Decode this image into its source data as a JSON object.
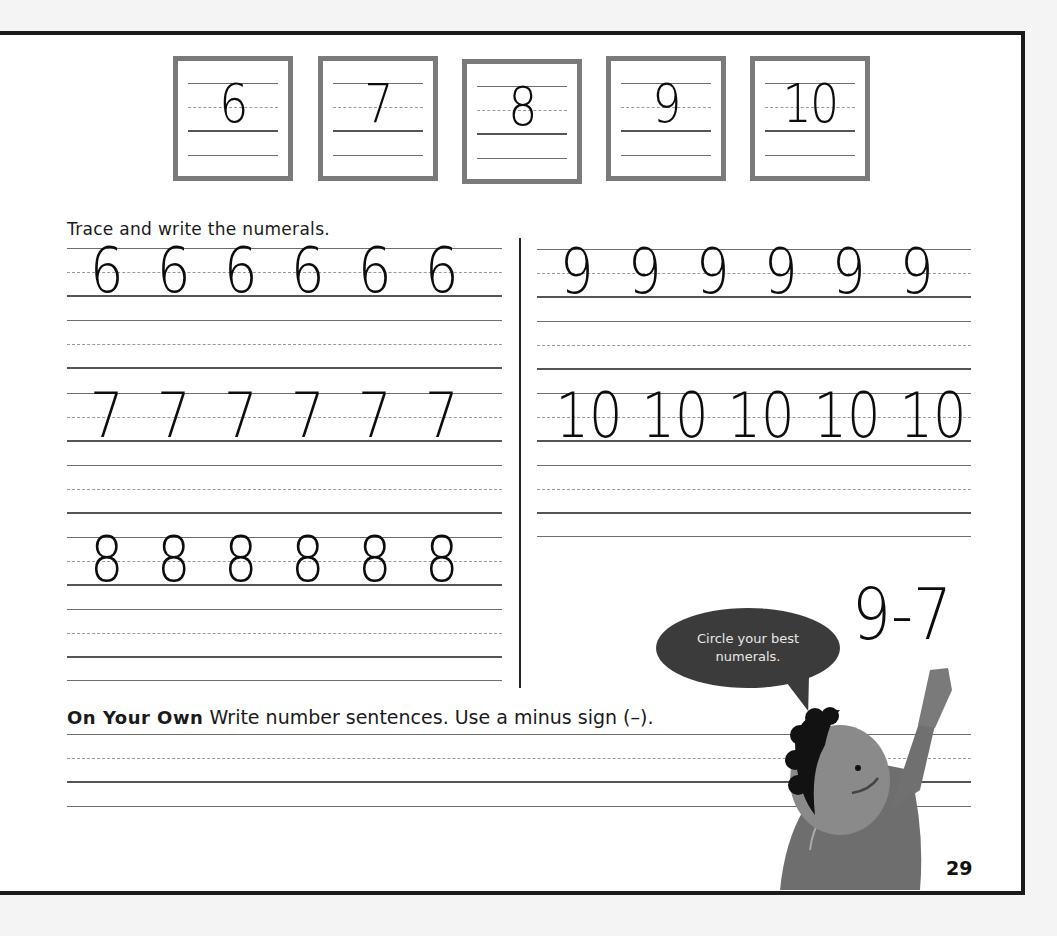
{
  "page": {
    "page_number": "29",
    "models": [
      "6",
      "7",
      "8",
      "9",
      "10"
    ],
    "instruction": "Trace and write the numerals.",
    "practice_rows": {
      "left": [
        {
          "numeral": "6",
          "count": 6,
          "digits": [
            "6",
            "6",
            "6",
            "6",
            "6",
            "6"
          ]
        },
        {
          "numeral": "7",
          "count": 6,
          "digits": [
            "7",
            "7",
            "7",
            "7",
            "7",
            "7"
          ]
        },
        {
          "numeral": "8",
          "count": 6,
          "digits": [
            "8",
            "8",
            "8",
            "8",
            "8",
            "8"
          ]
        }
      ],
      "right": [
        {
          "numeral": "9",
          "count": 6,
          "digits": [
            "9",
            "9",
            "9",
            "9",
            "9",
            "9"
          ]
        },
        {
          "numeral": "10",
          "count": 5,
          "digits": [
            "10",
            "10",
            "10",
            "10",
            "10"
          ]
        }
      ]
    },
    "on_your_own": {
      "label": "On Your Own",
      "text": "Write number sentences. Use a minus sign (–)."
    },
    "speech_bubble": "Circle your best numerals.",
    "example_equation": "9-7",
    "illustration": "child-pointing-illustration"
  }
}
